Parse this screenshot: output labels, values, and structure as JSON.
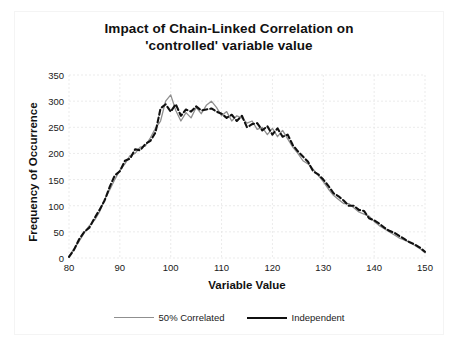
{
  "chart_data": {
    "type": "line",
    "title": "Impact of Chain-Linked Correlation on 'controlled' variable value",
    "title_line1": "Impact of Chain-Linked Correlation on",
    "title_line2": "'controlled' variable value",
    "xlabel": "Variable Value",
    "ylabel": "Frequency of Occurrence",
    "xlim": [
      80,
      150
    ],
    "ylim": [
      0,
      350
    ],
    "xticks": [
      80,
      90,
      100,
      110,
      120,
      130,
      140,
      150
    ],
    "yticks": [
      0,
      50,
      100,
      150,
      200,
      250,
      300,
      350
    ],
    "grid": true,
    "legend_position": "bottom",
    "colors": {
      "correlated": "#8f8f8f",
      "independent": "#101010",
      "grid": "#e6e6e6",
      "text": "#111111",
      "background": "#ffffff"
    },
    "x": [
      80,
      81,
      82,
      83,
      84,
      85,
      86,
      87,
      88,
      89,
      90,
      91,
      92,
      93,
      94,
      95,
      96,
      97,
      98,
      99,
      100,
      101,
      102,
      103,
      104,
      105,
      106,
      107,
      108,
      109,
      110,
      111,
      112,
      113,
      114,
      115,
      116,
      117,
      118,
      119,
      120,
      121,
      122,
      123,
      124,
      125,
      126,
      127,
      128,
      129,
      130,
      131,
      132,
      133,
      134,
      135,
      136,
      137,
      138,
      139,
      140,
      141,
      142,
      143,
      144,
      145,
      146,
      147,
      148,
      149,
      150
    ],
    "series": [
      {
        "name": "50% Correlated",
        "color": "#8f8f8f",
        "width": 1.3,
        "dash": "none",
        "values": [
          3,
          18,
          32,
          48,
          62,
          72,
          88,
          112,
          130,
          150,
          168,
          180,
          196,
          200,
          212,
          214,
          230,
          248,
          262,
          300,
          312,
          282,
          262,
          278,
          268,
          288,
          276,
          292,
          300,
          288,
          272,
          280,
          262,
          272,
          268,
          258,
          262,
          246,
          250,
          236,
          248,
          232,
          244,
          228,
          212,
          200,
          186,
          180,
          170,
          158,
          146,
          132,
          120,
          112,
          104,
          104,
          96,
          88,
          84,
          80,
          70,
          62,
          56,
          50,
          44,
          38,
          34,
          30,
          24,
          18,
          10
        ]
      },
      {
        "name": "Independent",
        "color": "#101010",
        "width": 2.1,
        "dash": "dashed",
        "values": [
          2,
          16,
          36,
          50,
          58,
          76,
          92,
          110,
          136,
          158,
          166,
          186,
          190,
          208,
          206,
          218,
          224,
          240,
          286,
          294,
          280,
          294,
          272,
          284,
          280,
          290,
          282,
          284,
          286,
          280,
          276,
          268,
          274,
          262,
          272,
          250,
          256,
          258,
          244,
          252,
          236,
          248,
          232,
          236,
          216,
          204,
          194,
          184,
          166,
          160,
          150,
          138,
          124,
          118,
          110,
          100,
          100,
          92,
          90,
          76,
          72,
          66,
          58,
          52,
          48,
          42,
          36,
          30,
          26,
          20,
          12
        ]
      }
    ]
  },
  "legend": {
    "items": [
      {
        "label": "50% Correlated",
        "key": "correlated"
      },
      {
        "label": "Independent",
        "key": "independent"
      }
    ]
  }
}
